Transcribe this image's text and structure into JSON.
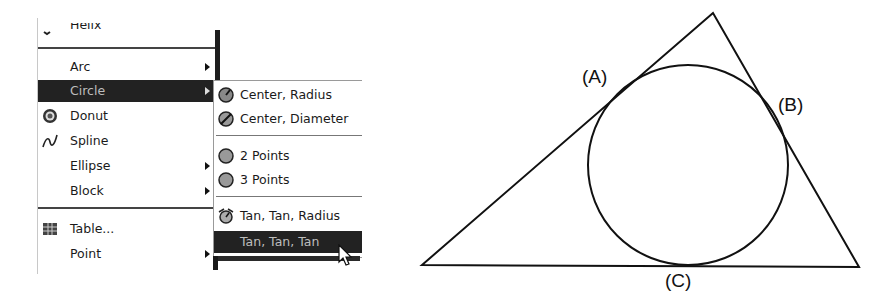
{
  "menu": {
    "items": [
      {
        "id": "helix",
        "label": "Helix",
        "underline": "x",
        "cut_off": true
      },
      {
        "id": "arc",
        "label": "Arc",
        "underline": "A",
        "has_submenu": true
      },
      {
        "id": "circle",
        "label": "Circle",
        "underline": "C",
        "has_submenu": true,
        "highlighted": true
      },
      {
        "id": "donut",
        "label": "Donut",
        "underline": "D",
        "icon": "donut-icon"
      },
      {
        "id": "spline",
        "label": "Spline",
        "underline": "S",
        "icon": "spline-icon"
      },
      {
        "id": "ellipse",
        "label": "Ellipse",
        "underline": "E",
        "has_submenu": true
      },
      {
        "id": "block",
        "label": "Block",
        "underline": "k",
        "has_submenu": true
      },
      {
        "id": "table",
        "label": "Table...",
        "icon": "table-icon"
      },
      {
        "id": "point",
        "label": "Point",
        "underline": "o",
        "has_submenu": true
      }
    ]
  },
  "submenu": {
    "parent": "Circle",
    "items": [
      {
        "id": "center-radius",
        "label": "Center, Radius",
        "icon": "circle-center-radius-icon"
      },
      {
        "id": "center-diameter",
        "label": "Center, Diameter",
        "icon": "circle-center-diameter-icon"
      },
      {
        "id": "2-points",
        "label": "2 Points",
        "icon": "circle-2-points-icon"
      },
      {
        "id": "3-points",
        "label": "3 Points",
        "icon": "circle-3-points-icon"
      },
      {
        "id": "tan-tan-radius",
        "label": "Tan, Tan, Radius",
        "icon": "circle-tan-tan-radius-icon"
      },
      {
        "id": "tan-tan-tan",
        "label": "Tan, Tan, Tan",
        "highlighted": true
      }
    ]
  },
  "drawing": {
    "labels": {
      "a": "(A)",
      "b": "(B)",
      "c": "(C)"
    },
    "triangle": {
      "top": [
        713,
        13
      ],
      "left": [
        422,
        265
      ],
      "right": [
        859,
        267
      ]
    },
    "circle": {
      "cx": 688,
      "cy": 165,
      "r": 100
    }
  }
}
